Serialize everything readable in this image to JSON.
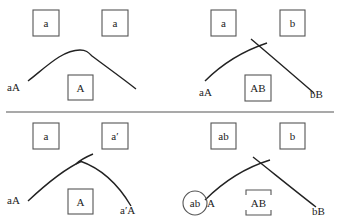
{
  "diagram": {
    "panels": [
      {
        "id": "top-left",
        "top_boxes": [
          "a",
          "a"
        ],
        "left_label": "aA",
        "center_box": "A",
        "right_label": ""
      },
      {
        "id": "top-right",
        "top_boxes": [
          "a",
          "b"
        ],
        "left_label": "aA",
        "center_box": "AB",
        "right_label": "bB"
      },
      {
        "id": "bottom-left",
        "top_boxes": [
          "a",
          "a′"
        ],
        "left_label": "aA",
        "center_box": "A",
        "right_label": "a′A"
      },
      {
        "id": "bottom-right",
        "top_boxes": [
          "ab",
          "b"
        ],
        "left_circle": "ab",
        "left_label": "A",
        "center_box": "AB",
        "right_label": "bB"
      }
    ]
  }
}
